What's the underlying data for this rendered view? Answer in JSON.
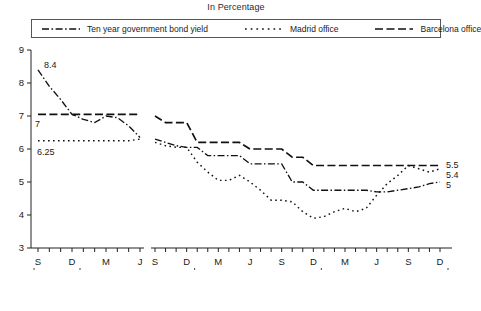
{
  "title": "In Percentage",
  "legend": {
    "items": [
      {
        "label": "Ten year government bond yield",
        "style": "dash-dot",
        "name": "legend-bond-yield"
      },
      {
        "label": "Madrid office",
        "style": "dotted",
        "name": "legend-madrid-office"
      },
      {
        "label": "Barcelona office",
        "style": "dashed",
        "name": "legend-barcelona-office"
      }
    ]
  },
  "annotations": {
    "start_bond": "8.4",
    "start_barcelona": "7",
    "start_madrid": "6.25",
    "end_barcelona": "5.5",
    "end_madrid": "5.4",
    "end_bond": "5"
  },
  "axes": {
    "y_ticks": [
      "3",
      "4",
      "5",
      "6",
      "7",
      "8",
      "9"
    ],
    "x_ticks_left": [
      "S",
      "D",
      "M",
      "J"
    ],
    "x_ticks_right": [
      "S",
      "D",
      "M",
      "J",
      "S",
      "D",
      "M",
      "J",
      "S",
      "D"
    ],
    "year_labels": [
      "1996",
      "1997",
      "1998",
      "1999"
    ]
  },
  "chart_data": {
    "type": "line",
    "title": "In Percentage",
    "xlabel": "",
    "ylabel": "In Percentage",
    "ylim": [
      3,
      9
    ],
    "grid": false,
    "legend_position": "top",
    "axis_break_after": "1996-06",
    "x": [
      "1996-09",
      "1996-10",
      "1996-11",
      "1996-12",
      "1997-01",
      "1997-02",
      "1997-03",
      "1997-04",
      "1997-05",
      "1997-06",
      "1997-09",
      "1997-10",
      "1997-11",
      "1997-12",
      "1998-01",
      "1998-02",
      "1998-03",
      "1998-04",
      "1998-05",
      "1998-06",
      "1998-07",
      "1998-08",
      "1998-09",
      "1998-10",
      "1998-11",
      "1998-12",
      "1999-01",
      "1999-02",
      "1999-03",
      "1999-04",
      "1999-05",
      "1999-06",
      "1999-07",
      "1999-08",
      "1999-09",
      "1999-10",
      "1999-11",
      "1999-12"
    ],
    "series": [
      {
        "name": "Ten year government bond yield",
        "style": "dash-dot",
        "values": [
          8.4,
          7.9,
          7.5,
          7.05,
          6.9,
          6.8,
          7.0,
          6.95,
          6.7,
          6.35,
          6.3,
          6.2,
          6.1,
          6.05,
          6.05,
          5.8,
          5.8,
          5.8,
          5.8,
          5.55,
          5.55,
          5.55,
          5.55,
          5.0,
          5.0,
          4.75,
          4.75,
          4.75,
          4.75,
          4.75,
          4.75,
          4.7,
          4.7,
          4.75,
          4.8,
          4.85,
          4.95,
          5.0
        ]
      },
      {
        "name": "Madrid office",
        "style": "dotted",
        "values": [
          6.25,
          6.25,
          6.25,
          6.25,
          6.25,
          6.25,
          6.25,
          6.25,
          6.25,
          6.3,
          6.2,
          6.1,
          6.05,
          6.05,
          5.6,
          5.3,
          5.05,
          5.05,
          5.2,
          5.0,
          4.75,
          4.45,
          4.45,
          4.4,
          4.1,
          3.9,
          3.95,
          4.1,
          4.2,
          4.1,
          4.2,
          4.6,
          4.95,
          5.2,
          5.5,
          5.4,
          5.3,
          5.4
        ]
      },
      {
        "name": "Barcelona office",
        "style": "dashed",
        "values": [
          7.05,
          7.05,
          7.05,
          7.05,
          7.05,
          7.05,
          7.05,
          7.05,
          7.05,
          7.05,
          7.0,
          6.8,
          6.8,
          6.8,
          6.2,
          6.2,
          6.2,
          6.2,
          6.2,
          6.0,
          6.0,
          6.0,
          6.0,
          5.75,
          5.75,
          5.5,
          5.5,
          5.5,
          5.5,
          5.5,
          5.5,
          5.5,
          5.5,
          5.5,
          5.5,
          5.5,
          5.5,
          5.5
        ]
      }
    ]
  }
}
